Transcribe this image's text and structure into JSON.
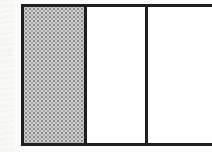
{
  "diagram": {
    "type": "fraction-bar",
    "total_sections": 3,
    "shaded_sections": 1,
    "shaded_fraction": "1/3",
    "sections": [
      {
        "index": 1,
        "shaded": true,
        "fill": "stipple-gray"
      },
      {
        "index": 2,
        "shaded": false,
        "fill": "white"
      },
      {
        "index": 3,
        "shaded": false,
        "fill": "white",
        "clipped_right": true
      }
    ],
    "colors": {
      "background": "#fbfbf9",
      "border": "#1f1f1f",
      "white_cell": "#ffffff",
      "stipple_base": "#cccccc",
      "stipple_dot": "#8e8e8e",
      "stipple_dot2": "#aaaaaa"
    }
  }
}
